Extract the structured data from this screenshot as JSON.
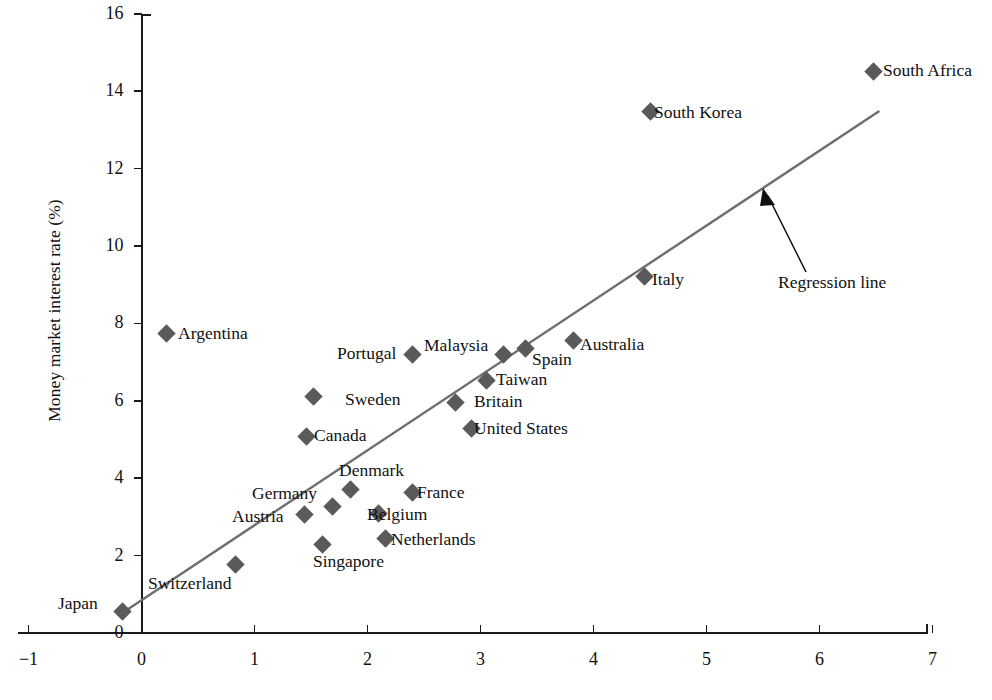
{
  "chart_data": {
    "type": "scatter",
    "title": "",
    "xlabel": "",
    "ylabel": "Money market interest rate (%)",
    "xlim": [
      -1,
      7
    ],
    "ylim": [
      0,
      16
    ],
    "xticks": [
      "-1",
      "0",
      "1",
      "2",
      "3",
      "4",
      "5",
      "6",
      "7"
    ],
    "yticks": [
      "0",
      "2",
      "4",
      "6",
      "8",
      "10",
      "12",
      "14",
      "16"
    ],
    "grid": false,
    "legend": "none",
    "marker_color": "#5a5a5a",
    "line_color": "#6e6e6e",
    "points": [
      {
        "name": "Japan",
        "x": -0.17,
        "y": 0.55,
        "label_side": "left"
      },
      {
        "name": "Switzerland",
        "x": 0.83,
        "y": 1.78,
        "label_side": "callout"
      },
      {
        "name": "Argentina",
        "x": 0.22,
        "y": 7.73,
        "label_side": "right"
      },
      {
        "name": "Austria",
        "x": 1.44,
        "y": 3.05,
        "label_side": "left"
      },
      {
        "name": "Canada",
        "x": 1.46,
        "y": 5.08,
        "label_side": "right"
      },
      {
        "name": "Sweden",
        "x": 1.52,
        "y": 6.12,
        "label_side": "right"
      },
      {
        "name": "Singapore",
        "x": 1.6,
        "y": 2.28,
        "label_side": "below"
      },
      {
        "name": "Germany",
        "x": 1.69,
        "y": 3.28,
        "label_side": "left"
      },
      {
        "name": "Denmark",
        "x": 1.85,
        "y": 3.72,
        "label_side": "above"
      },
      {
        "name": "Belgium",
        "x": 2.1,
        "y": 3.08,
        "label_side": "right"
      },
      {
        "name": "Netherlands",
        "x": 2.16,
        "y": 2.45,
        "label_side": "right"
      },
      {
        "name": "France",
        "x": 2.4,
        "y": 3.62,
        "label_side": "right"
      },
      {
        "name": "Portugal",
        "x": 2.4,
        "y": 7.2,
        "label_side": "left"
      },
      {
        "name": "Britain",
        "x": 2.78,
        "y": 5.95,
        "label_side": "right"
      },
      {
        "name": "United States",
        "x": 2.92,
        "y": 5.28,
        "label_side": "right"
      },
      {
        "name": "Taiwan",
        "x": 3.05,
        "y": 6.52,
        "label_side": "right"
      },
      {
        "name": "Malaysia",
        "x": 3.2,
        "y": 7.2,
        "label_side": "above"
      },
      {
        "name": "Spain",
        "x": 3.4,
        "y": 7.35,
        "label_side": "below"
      },
      {
        "name": "Australia",
        "x": 3.82,
        "y": 7.55,
        "label_side": "right"
      },
      {
        "name": "Italy",
        "x": 4.45,
        "y": 9.2,
        "label_side": "right"
      },
      {
        "name": "South Korea",
        "x": 4.5,
        "y": 13.48,
        "label_side": "right"
      },
      {
        "name": "South Africa",
        "x": 6.48,
        "y": 14.52,
        "label_side": "right"
      }
    ],
    "regression_line": {
      "label": "Regression line",
      "x_start": -0.17,
      "y_start": 0.52,
      "x_end": 6.53,
      "y_end": 13.49
    },
    "annotations": [
      {
        "name": "regression-annotation",
        "text": "Regression line"
      }
    ]
  }
}
